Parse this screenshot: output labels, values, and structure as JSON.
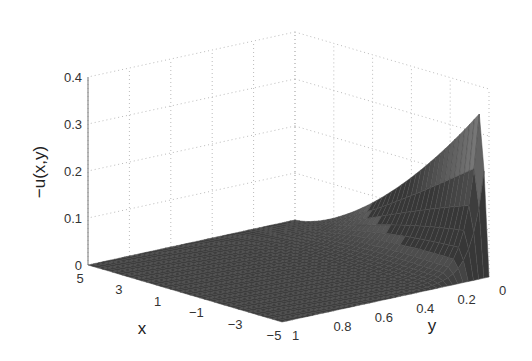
{
  "chart_data": {
    "type": "surface3d",
    "title": "",
    "zlabel": "−u(x,y)",
    "xlabel": "x",
    "ylabel": "y",
    "x_ticks": [
      "5",
      "3",
      "1",
      "−1",
      "−3",
      "−5"
    ],
    "x_tick_values": [
      5,
      3,
      1,
      -1,
      -3,
      -5
    ],
    "y_ticks": [
      "1",
      "0.8",
      "0.6",
      "0.4",
      "0.2",
      "0"
    ],
    "y_tick_values": [
      1,
      0.8,
      0.6,
      0.4,
      0.2,
      0
    ],
    "z_ticks": [
      "0",
      "0.1",
      "0.2",
      "0.3",
      "0.4"
    ],
    "z_tick_values": [
      0,
      0.1,
      0.2,
      0.3,
      0.4
    ],
    "xlim": [
      -5,
      5
    ],
    "ylim": [
      0,
      1
    ],
    "zlim": [
      0,
      0.4
    ],
    "grid": true,
    "samples": [
      {
        "x": 5,
        "y": 0,
        "z": 0.0
      },
      {
        "x": 1,
        "y": 0,
        "z": 0.12
      },
      {
        "x": -3,
        "y": 0,
        "z": 0.3
      },
      {
        "x": -4.6,
        "y": 0,
        "z": 0.37
      },
      {
        "x": -5,
        "y": 0,
        "z": 0.0
      },
      {
        "x": -3,
        "y": 0.5,
        "z": 0.03
      },
      {
        "x": -3,
        "y": 1,
        "z": 0.0
      }
    ]
  },
  "colors": {
    "surface_light": "#e6e6e6",
    "surface_dark": "#3a3a3a",
    "edge": "#555555",
    "grid": "#bbbbbb"
  }
}
